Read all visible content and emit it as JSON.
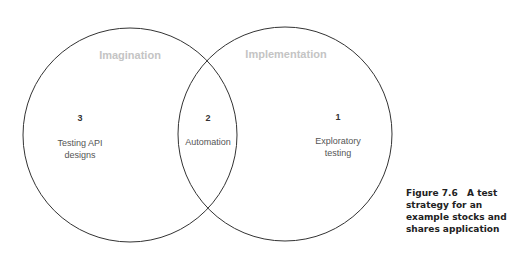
{
  "diagram": {
    "type": "venn",
    "sets": [
      {
        "label": "Imagination"
      },
      {
        "label": "Implementation"
      }
    ],
    "regions": [
      {
        "number": "3",
        "text_line1": "Testing API",
        "text_line2": "designs"
      },
      {
        "number": "2",
        "text_line1": "Automation"
      },
      {
        "number": "1",
        "text_line1": "Exploratory",
        "text_line2": "testing"
      }
    ],
    "stroke_color": "#333333",
    "set_label_color": "#c4c4c4"
  },
  "caption": {
    "figure": "Figure 7.6",
    "text": "A test strategy for an example stocks and shares application"
  }
}
